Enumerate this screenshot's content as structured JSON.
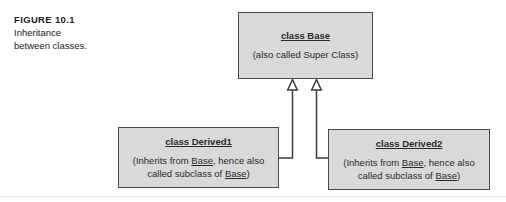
{
  "figure": {
    "number_label": "FIGURE 10.1",
    "caption_line_1": "Inheritance",
    "caption_line_2": "between classes.",
    "diagram_type": "uml-class-inheritance",
    "background_color": "#ffffff",
    "box_fill_color": "#d9d9d9",
    "box_border_color": "#4a4a4a",
    "connector_color": "#3c3c3c",
    "arrowhead_style": "hollow-triangle-generalization",
    "arrowhead_fill": "#ffffff"
  },
  "boxes": {
    "base": {
      "title": "class Base",
      "note": "(also called Super Class)",
      "role": "superclass"
    },
    "derived1": {
      "title": "class Derived1",
      "note_prefix": "(Inherits from ",
      "note_link_1": "Base",
      "note_middle": ", hence also called subclass of ",
      "note_link_2": "Base",
      "note_suffix": ")",
      "role": "subclass"
    },
    "derived2": {
      "title": "class Derived2",
      "note_prefix": "(Inherits from ",
      "note_link_1": "Base",
      "note_middle": ", hence also called subclass of ",
      "note_link_2": "Base",
      "note_suffix": ")",
      "role": "subclass"
    }
  },
  "relationships": [
    {
      "from": "derived1",
      "to": "base",
      "kind": "inheritance"
    },
    {
      "from": "derived2",
      "to": "base",
      "kind": "inheritance"
    }
  ]
}
